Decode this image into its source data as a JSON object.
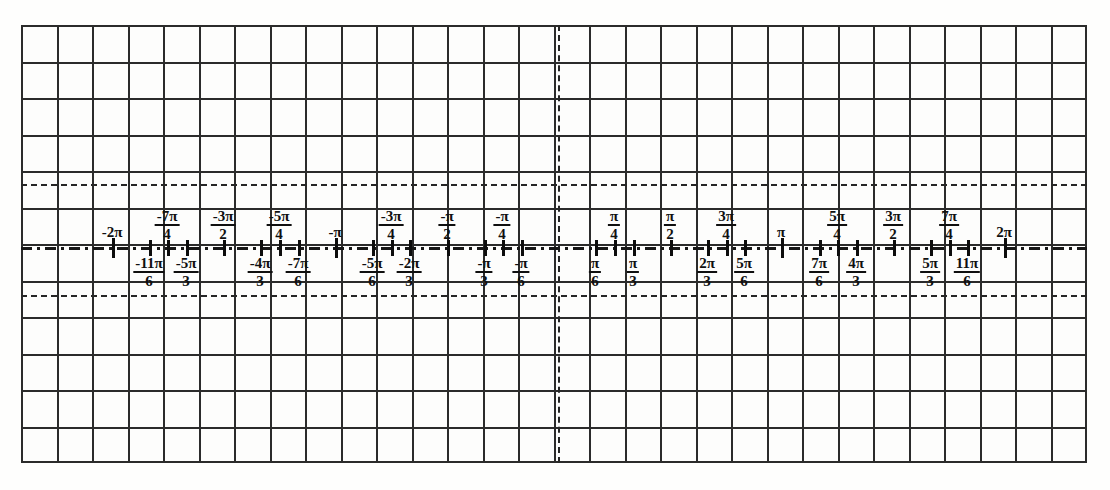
{
  "document": {
    "kind": "math-worksheet-number-line",
    "title_text": "",
    "description": "Radian measure number line on graph paper from -2π to 2π"
  },
  "colors": {
    "paper": "#fdfdfc",
    "grid": "#2b2b2b",
    "ink": "#101010",
    "axis": "#161616"
  },
  "grid": {
    "columns": 30,
    "rows": 12,
    "cell_px": 35.5
  },
  "axis": {
    "origin_label": "",
    "min_label": "-2π",
    "max_label": "2π",
    "pi_px": 223
  },
  "ticks_above": [
    {
      "id": "neg-2pi",
      "x": 112,
      "num": "-2π",
      "den": "",
      "frac": false,
      "major": true
    },
    {
      "id": "neg-7pi-4",
      "x": 167,
      "num": "-7π",
      "den": "4",
      "frac": true,
      "major": false
    },
    {
      "id": "neg-3pi-2",
      "x": 223,
      "num": "-3π",
      "den": "2",
      "frac": true,
      "major": false
    },
    {
      "id": "neg-5pi-4",
      "x": 279,
      "num": "-5π",
      "den": "4",
      "frac": true,
      "major": false
    },
    {
      "id": "neg-pi",
      "x": 335,
      "num": "-π",
      "den": "",
      "frac": false,
      "major": true
    },
    {
      "id": "neg-3pi-4",
      "x": 391,
      "num": "-3π",
      "den": "4",
      "frac": true,
      "major": false
    },
    {
      "id": "neg-pi-2",
      "x": 447,
      "num": "-π",
      "den": "2",
      "frac": true,
      "major": false
    },
    {
      "id": "neg-pi-4",
      "x": 502,
      "num": "-π",
      "den": "4",
      "frac": true,
      "major": false
    },
    {
      "id": "pos-pi-4",
      "x": 614,
      "num": "π",
      "den": "4",
      "frac": true,
      "major": false
    },
    {
      "id": "pos-pi-2",
      "x": 670,
      "num": "π",
      "den": "2",
      "frac": true,
      "major": false
    },
    {
      "id": "pos-3pi-4",
      "x": 726,
      "num": "3π",
      "den": "4",
      "frac": true,
      "major": false
    },
    {
      "id": "pos-pi",
      "x": 781,
      "num": "π",
      "den": "",
      "frac": false,
      "major": true
    },
    {
      "id": "pos-5pi-4",
      "x": 837,
      "num": "5π",
      "den": "4",
      "frac": true,
      "major": false
    },
    {
      "id": "pos-3pi-2",
      "x": 893,
      "num": "3π",
      "den": "2",
      "frac": true,
      "major": false
    },
    {
      "id": "pos-7pi-4",
      "x": 949,
      "num": "7π",
      "den": "4",
      "frac": true,
      "major": false
    },
    {
      "id": "pos-2pi",
      "x": 1004,
      "num": "2π",
      "den": "",
      "frac": false,
      "major": true
    }
  ],
  "ticks_below": [
    {
      "id": "neg-11pi-6",
      "x": 149,
      "num": "-11π",
      "den": "6",
      "frac": true
    },
    {
      "id": "neg-5pi-3",
      "x": 186,
      "num": "-5π",
      "den": "3",
      "frac": true
    },
    {
      "id": "neg-4pi-3",
      "x": 260,
      "num": "-4π",
      "den": "3",
      "frac": true
    },
    {
      "id": "neg-7pi-6",
      "x": 298,
      "num": "-7π",
      "den": "6",
      "frac": true
    },
    {
      "id": "neg-5pi-6",
      "x": 372,
      "num": "-5π",
      "den": "6",
      "frac": true
    },
    {
      "id": "neg-2pi-3",
      "x": 409,
      "num": "-2π",
      "den": "3",
      "frac": true
    },
    {
      "id": "neg-pi-3",
      "x": 484,
      "num": "-π",
      "den": "3",
      "frac": true
    },
    {
      "id": "neg-pi-6",
      "x": 521,
      "num": "-π",
      "den": "6",
      "frac": true
    },
    {
      "id": "pos-pi-6",
      "x": 595,
      "num": "π",
      "den": "6",
      "frac": true
    },
    {
      "id": "pos-pi-3",
      "x": 633,
      "num": "π",
      "den": "3",
      "frac": true
    },
    {
      "id": "pos-2pi-3",
      "x": 707,
      "num": "2π",
      "den": "3",
      "frac": true
    },
    {
      "id": "pos-5pi-6",
      "x": 744,
      "num": "5π",
      "den": "6",
      "frac": true
    },
    {
      "id": "pos-7pi-6",
      "x": 819,
      "num": "7π",
      "den": "6",
      "frac": true
    },
    {
      "id": "pos-4pi-3",
      "x": 856,
      "num": "4π",
      "den": "3",
      "frac": true
    },
    {
      "id": "pos-5pi-3",
      "x": 930,
      "num": "5π",
      "den": "3",
      "frac": true
    },
    {
      "id": "pos-11pi-6",
      "x": 967,
      "num": "11π",
      "den": "6",
      "frac": true
    }
  ],
  "guides": {
    "vertical_axis_x": 558,
    "upper_dashed_y": 184,
    "lower_dashed_y": 295,
    "axis_y": 247
  }
}
